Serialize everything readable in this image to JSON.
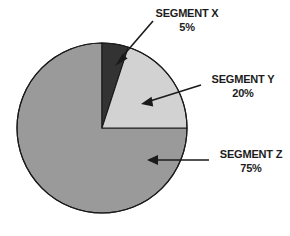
{
  "chart_data": {
    "type": "pie",
    "title": "",
    "subtitle": "",
    "xlabel": "",
    "ylabel": "",
    "legend_position": "callout-labels",
    "grid": false,
    "units": "%",
    "start_angle_deg": 0,
    "direction": "clockwise",
    "categories": [
      "SEGMENT X",
      "SEGMENT Y",
      "SEGMENT Z"
    ],
    "values": [
      5,
      20,
      75
    ],
    "slices": [
      {
        "label": "SEGMENT X",
        "value": 5,
        "value_label": "5%",
        "color": "#333333",
        "start_angle_deg": 0,
        "end_angle_deg": 18
      },
      {
        "label": "SEGMENT Y",
        "value": 20,
        "value_label": "20%",
        "color": "#d2d2d2",
        "start_angle_deg": 18,
        "end_angle_deg": 90
      },
      {
        "label": "SEGMENT Z",
        "value": 75,
        "value_label": "75%",
        "color": "#9a9a9a",
        "start_angle_deg": 90,
        "end_angle_deg": 360
      }
    ]
  },
  "colors": {
    "background": "#ffffff",
    "outline": "#1a1a1a",
    "text": "#1c1c1c",
    "segment_x": "#333333",
    "segment_y": "#d2d2d2",
    "segment_z": "#9a9a9a"
  },
  "callouts": {
    "segment_x": {
      "name": "SEGMENT X",
      "value": "5%"
    },
    "segment_y": {
      "name": "SEGMENT Y",
      "value": "20%"
    },
    "segment_z": {
      "name": "SEGMENT Z",
      "value": "75%"
    }
  }
}
